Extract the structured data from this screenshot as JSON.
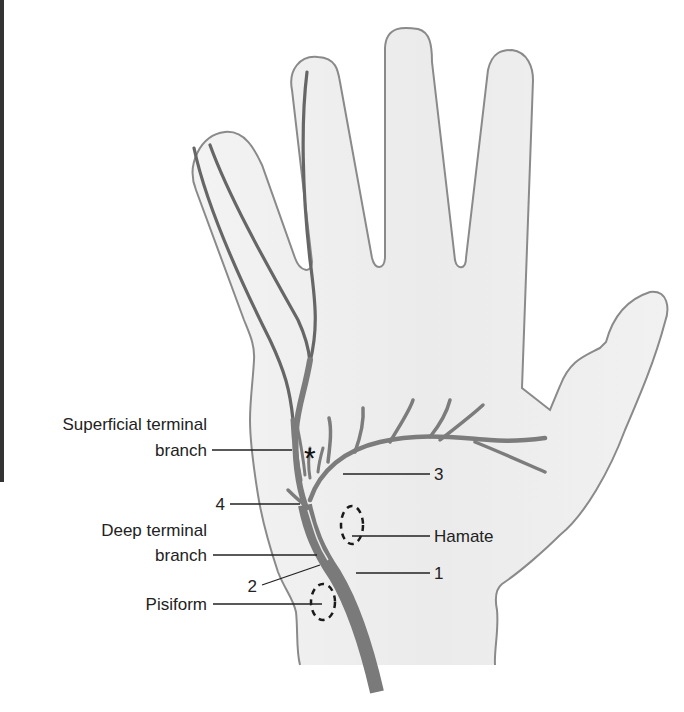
{
  "figure": {
    "colors": {
      "background": "#ffffff",
      "hand_fill": "#ececec",
      "hand_outline": "#8a8a8a",
      "nerve": "#7a7a7a",
      "nerve_dark": "#5e5e5e",
      "leader_line": "#222222",
      "bone_outline": "#1a1a1a",
      "left_bar": "#333333"
    }
  },
  "labels": {
    "superficial_line1": "Superficial terminal",
    "superficial_line2": "branch",
    "four": "4",
    "deep_line1": "Deep terminal",
    "deep_line2": "branch",
    "two": "2",
    "pisiform": "Pisiform",
    "three": "3",
    "hamate": "Hamate",
    "one": "1",
    "asterisk": "*"
  }
}
